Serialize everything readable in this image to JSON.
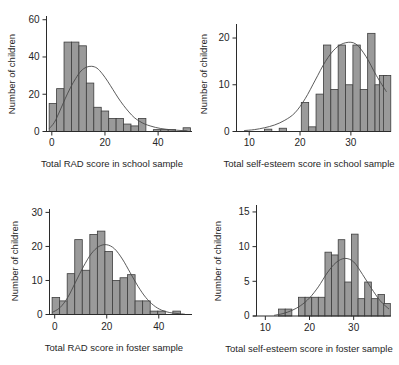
{
  "figure": {
    "title": "",
    "panel_count": 4
  },
  "chart_data": [
    {
      "id": "rad-school",
      "type": "bar",
      "title": "",
      "xlabel": "Total RAD score in school sample",
      "ylabel": "Number of children",
      "xlim": [
        -2,
        52
      ],
      "ylim": [
        0,
        62
      ],
      "xticks": [
        0,
        20,
        40
      ],
      "yticks": [
        0,
        20,
        40,
        60
      ],
      "grid": false,
      "legend": "none",
      "bin_width": 2.8,
      "bin_starts": [
        -1.0,
        1.8,
        4.6,
        7.4,
        10.2,
        13.0,
        15.8,
        18.6,
        21.4,
        24.2,
        27.0,
        29.8,
        32.6,
        35.4,
        38.2,
        41.0,
        43.8,
        46.6,
        49.4
      ],
      "categories": [
        "0",
        "3",
        "6",
        "9",
        "12",
        "14",
        "17",
        "20",
        "23",
        "26",
        "28",
        "31",
        "34",
        "37",
        "40",
        "42",
        "45",
        "48",
        "51"
      ],
      "values": [
        15,
        23,
        48,
        48,
        46,
        26,
        13,
        11,
        7,
        7,
        4,
        3,
        7,
        0,
        1,
        1,
        1,
        0,
        2
      ],
      "curve": {
        "name": "normal-fit",
        "peak_x": 15.0,
        "peak_y": 35,
        "points_x": [
          -1,
          1,
          3,
          5,
          7,
          9,
          11,
          13,
          15,
          17,
          19,
          21,
          23,
          25,
          27,
          29,
          31,
          33,
          35,
          37,
          39,
          41,
          43,
          45,
          47,
          49,
          51
        ],
        "points_y": [
          1.5,
          5,
          11,
          17.5,
          23.5,
          28.5,
          32.5,
          34.5,
          35,
          34,
          31,
          27,
          22.5,
          18,
          14,
          10.5,
          7.5,
          5.5,
          4,
          3,
          2.2,
          1.6,
          1.2,
          0.9,
          0.7,
          0.5,
          0.4
        ]
      }
    },
    {
      "id": "selfesteem-school",
      "type": "bar",
      "title": "",
      "xlabel": "Total self-esteem score in school sample",
      "ylabel": "Number of children",
      "xlim": [
        7.5,
        37.5
      ],
      "ylim": [
        0,
        23
      ],
      "xticks": [
        10,
        20,
        30
      ],
      "yticks": [
        0,
        10,
        20
      ],
      "grid": false,
      "legend": "none",
      "bin_width": 1.45,
      "bin_starts": [
        13.0,
        14.45,
        15.9,
        17.35,
        18.8,
        20.25,
        21.7,
        23.15,
        24.6,
        26.05,
        27.5,
        28.95,
        30.4,
        31.85,
        33.3,
        34.75
      ],
      "categories": [
        "13",
        "14",
        "16",
        "17",
        "19",
        "20",
        "22",
        "23",
        "25",
        "26",
        "28",
        "29",
        "30",
        "32",
        "33",
        "35"
      ],
      "values": [
        0.5,
        0,
        0.7,
        0,
        0,
        6.2,
        1,
        8,
        18.5,
        9,
        18.5,
        10,
        18.5,
        9,
        21,
        10
      ],
      "extra_bars": [
        {
          "x": 35.6,
          "value": 12
        },
        {
          "x": 36.4,
          "value": 12
        }
      ],
      "curve": {
        "name": "normal-fit",
        "peak_x": 30.3,
        "peak_y": 19,
        "points_x": [
          9,
          11,
          13,
          15,
          17,
          19,
          21,
          23,
          25,
          27,
          29,
          31,
          33,
          35,
          37
        ],
        "points_y": [
          0.2,
          0.4,
          0.8,
          1.4,
          2.4,
          4.0,
          7.0,
          11.0,
          15.0,
          17.8,
          19.0,
          18.7,
          16.0,
          12.0,
          8.5
        ]
      }
    },
    {
      "id": "rad-foster",
      "type": "bar",
      "title": "",
      "xlabel": "Total RAD score in foster sample",
      "ylabel": "Number of children",
      "xlim": [
        -2,
        52
      ],
      "ylim": [
        0,
        31
      ],
      "xticks": [
        0,
        20,
        40
      ],
      "yticks": [
        0,
        10,
        20,
        30
      ],
      "grid": false,
      "legend": "none",
      "bin_width": 2.9,
      "bin_starts": [
        -1.0,
        1.9,
        4.8,
        7.7,
        10.6,
        13.5,
        16.4,
        19.3,
        22.2,
        25.1,
        28.0,
        30.9,
        33.8,
        36.7,
        39.6,
        42.5,
        45.4,
        48.3
      ],
      "categories": [
        "0",
        "3",
        "6",
        "9",
        "12",
        "15",
        "17",
        "20",
        "23",
        "26",
        "29",
        "32",
        "35",
        "38",
        "41",
        "44",
        "46",
        "49"
      ],
      "values": [
        5,
        4,
        12,
        22,
        13,
        23.5,
        24.5,
        18.5,
        10,
        10.8,
        11.7,
        4,
        4,
        1,
        1,
        0,
        1,
        0
      ],
      "curve": {
        "name": "normal-fit",
        "peak_x": 21.5,
        "peak_y": 20.5,
        "points_x": [
          -1,
          2,
          5,
          8,
          11,
          14,
          17,
          20,
          23,
          26,
          29,
          32,
          35,
          38,
          41,
          44,
          47,
          50
        ],
        "points_y": [
          0.6,
          2.0,
          5.0,
          9.5,
          14.0,
          17.8,
          20.0,
          20.5,
          19.3,
          16.3,
          12.3,
          8.3,
          5.0,
          2.7,
          1.3,
          0.6,
          0.3,
          0.1
        ]
      }
    },
    {
      "id": "selfesteem-foster",
      "type": "bar",
      "title": "",
      "xlabel": "Total self-esteem score in foster sample",
      "ylabel": "Number of children",
      "xlim": [
        8,
        38
      ],
      "ylim": [
        0,
        16
      ],
      "xticks": [
        10,
        20,
        30
      ],
      "yticks": [
        0,
        5,
        10,
        15
      ],
      "grid": false,
      "legend": "none",
      "bin_width": 1.5,
      "bin_starts": [
        13.0,
        14.5,
        16.0,
        17.5,
        19.0,
        20.5,
        22.0,
        23.5,
        25.0,
        26.5,
        28.0,
        29.5,
        31.0,
        32.5,
        34.0,
        35.5
      ],
      "categories": [
        "13",
        "15",
        "16",
        "18",
        "19",
        "21",
        "22",
        "24",
        "25",
        "27",
        "28",
        "30",
        "31",
        "33",
        "34",
        "36"
      ],
      "values": [
        1,
        1,
        0,
        2.7,
        2.7,
        2.7,
        2.7,
        9.2,
        8.8,
        11,
        4.9,
        11.8,
        2.5,
        4.9,
        2.5,
        3.1
      ],
      "extra_bars": [
        {
          "x": 36.8,
          "value": 1.8
        }
      ],
      "curve": {
        "name": "normal-fit",
        "peak_x": 28.5,
        "peak_y": 8.3,
        "points_x": [
          12,
          14,
          16,
          18,
          20,
          22,
          24,
          26,
          28,
          30,
          32,
          34,
          36,
          38
        ],
        "points_y": [
          0.1,
          0.35,
          0.8,
          1.5,
          2.6,
          4.2,
          6.2,
          7.7,
          8.3,
          7.8,
          6.0,
          4.0,
          2.2,
          1.0
        ]
      }
    }
  ]
}
